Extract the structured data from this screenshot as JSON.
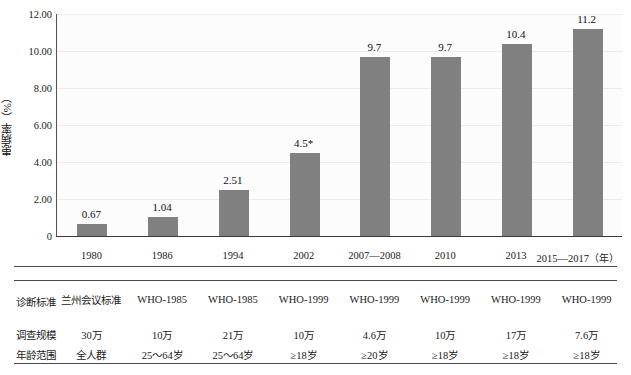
{
  "chart_data": {
    "type": "bar",
    "title": "",
    "xlabel": "（年）",
    "ylabel": "患病率（%）",
    "ylim": [
      0,
      12
    ],
    "yticks": [
      "0",
      "2.00",
      "4.00",
      "6.00",
      "8.00",
      "10.00",
      "12.00"
    ],
    "ytick_values": [
      0,
      2,
      4,
      6,
      8,
      10,
      12
    ],
    "grid": true,
    "legend": "none",
    "categories": [
      "1980",
      "1986",
      "1994",
      "2002",
      "2007—2008",
      "2010",
      "2013",
      "2015—2017"
    ],
    "values": [
      0.67,
      1.04,
      2.51,
      4.5,
      9.7,
      9.7,
      10.4,
      11.2
    ],
    "data_labels": [
      "0.67",
      "1.04",
      "2.51",
      "4.5*",
      "9.7",
      "9.7",
      "10.4",
      "11.2"
    ],
    "bar_color": "#808080",
    "plot_background": "#fcfcfc",
    "gridline_color": "#ececec",
    "axis_color": "#3a3a3a"
  },
  "axis": {
    "x_unit": "（年）"
  },
  "table": {
    "row_labels": [
      "诊断标准",
      "调查规模",
      "年龄范围"
    ],
    "rows": [
      {
        "label": "诊断标准",
        "cells": [
          "兰州会议标准",
          "WHO-1985",
          "WHO-1985",
          "WHO-1999",
          "WHO-1999",
          "WHO-1999",
          "WHO-1999",
          "WHO-1999"
        ]
      },
      {
        "label": "调查规模",
        "cells": [
          "30万",
          "10万",
          "21万",
          "10万",
          "4.6万",
          "10万",
          "17万",
          "7.6万"
        ]
      },
      {
        "label": "年龄范围",
        "cells": [
          "全人群",
          "25～64岁",
          "25～64岁",
          "≥18岁",
          "≥20岁",
          "≥18岁",
          "≥18岁",
          "≥18岁"
        ]
      }
    ]
  },
  "caption": {
    "text": ""
  }
}
